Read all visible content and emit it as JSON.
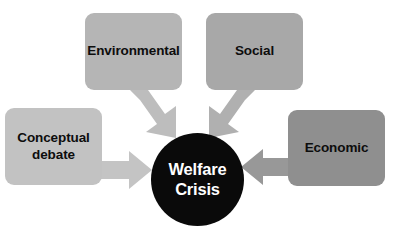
{
  "diagram": {
    "type": "converging-arrow-diagram",
    "background_color": "#ffffff",
    "center": {
      "label": "Welfare\nCrisis",
      "shape": "circle",
      "fill_color": "#0a0a0a",
      "text_color": "#ffffff"
    },
    "nodes": [
      {
        "id": "environmental",
        "label": "Environmental",
        "shape": "rounded-rectangle",
        "fill_color": "#b5b5b5",
        "text_color": "#0d0d0d",
        "position": "top-left"
      },
      {
        "id": "social",
        "label": "Social",
        "shape": "rounded-rectangle",
        "fill_color": "#a8a8a8",
        "text_color": "#0d0d0d",
        "position": "top-right"
      },
      {
        "id": "conceptual-debate",
        "label": "Conceptual\ndebate",
        "shape": "rounded-rectangle",
        "fill_color": "#c2c2c2",
        "text_color": "#0d0d0d",
        "position": "left"
      },
      {
        "id": "economic",
        "label": "Economic",
        "shape": "rounded-rectangle",
        "fill_color": "#8f8f8f",
        "text_color": "#0d0d0d",
        "position": "right"
      }
    ],
    "arrows": [
      {
        "id": "environmental-to-center",
        "from": "environmental",
        "to": "center",
        "direction": "down-right",
        "fill_color": "#bdbdbd"
      },
      {
        "id": "social-to-center",
        "from": "social",
        "to": "center",
        "direction": "down-left",
        "fill_color": "#b0b0b0"
      },
      {
        "id": "conceptual-to-center",
        "from": "conceptual-debate",
        "to": "center",
        "direction": "right",
        "fill_color": "#c4c4c4"
      },
      {
        "id": "economic-to-center",
        "from": "economic",
        "to": "center",
        "direction": "left",
        "fill_color": "#989898"
      }
    ]
  }
}
